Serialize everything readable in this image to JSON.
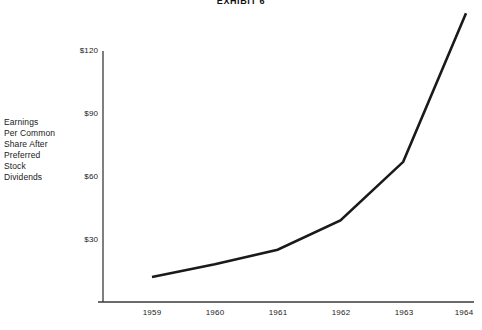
{
  "chart_data": {
    "type": "line",
    "title": "EXHIBIT 6",
    "xlabel": "",
    "ylabel": "Earnings Per Common Share After Preferred Stock Dividends",
    "ylabel_lines": [
      "Earnings",
      "Per Common",
      "Share After",
      "Preferred",
      "Stock",
      "Dividends"
    ],
    "categories": [
      "1959",
      "1960",
      "1961",
      "1962",
      "1963",
      "1964"
    ],
    "x": [
      1959,
      1960,
      1961,
      1962,
      1963,
      1964
    ],
    "values": [
      12,
      18,
      25,
      39,
      67,
      138
    ],
    "y_ticks": [
      30,
      60,
      90,
      120
    ],
    "y_tick_labels": [
      "$30",
      "$60",
      "$90",
      "$120"
    ],
    "ylim": [
      0,
      145
    ],
    "xlim": [
      1958.6,
      1964.5
    ],
    "grid": false,
    "legend": false,
    "line_color": "#1a1a1a",
    "line_width": 2.6,
    "axis_color": "#3a3a3a",
    "background": "#ffffff"
  },
  "axes": {
    "y_axis_name": "dollars-axis",
    "x_axis_name": "year-axis"
  }
}
